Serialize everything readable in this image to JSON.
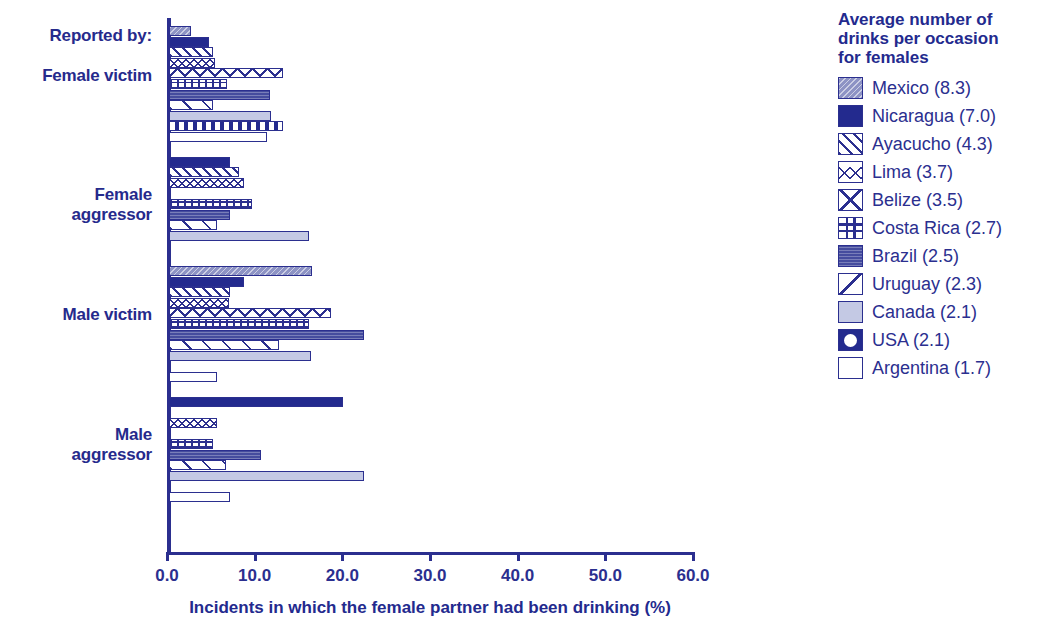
{
  "axis": {
    "x_title": "Incidents in which the female partner had been drinking (%)",
    "x_ticks": [
      "0.0",
      "10.0",
      "20.0",
      "30.0",
      "40.0",
      "50.0",
      "60.0"
    ],
    "reported_by_label": "Reported by:"
  },
  "legend": {
    "title": "Average number of\ndrinks per occasion\nfor females",
    "entries": [
      {
        "label": "Mexico (8.3)",
        "key": "mexico",
        "swatch": "swatch-mexico"
      },
      {
        "label": "Nicaragua (7.0)",
        "key": "nicaragua",
        "swatch": "swatch-nicaragua"
      },
      {
        "label": "Ayacucho (4.3)",
        "key": "ayacucho",
        "swatch": "swatch-ayacucho"
      },
      {
        "label": "Lima (3.7)",
        "key": "lima",
        "swatch": "swatch-lima"
      },
      {
        "label": "Belize (3.5)",
        "key": "belize",
        "swatch": "swatch-belize"
      },
      {
        "label": "Costa Rica (2.7)",
        "key": "costarica",
        "swatch": "swatch-costa-rica"
      },
      {
        "label": "Brazil (2.5)",
        "key": "brazil",
        "swatch": "swatch-brazil"
      },
      {
        "label": "Uruguay (2.3)",
        "key": "uruguay",
        "swatch": "swatch-uruguay"
      },
      {
        "label": "Canada (2.1)",
        "key": "canada",
        "swatch": "swatch-canada"
      },
      {
        "label": "USA (2.1)",
        "key": "usa",
        "swatch": "swatch-usa"
      },
      {
        "label": "Argentina (1.7)",
        "key": "argentina",
        "swatch": "swatch-argentina"
      }
    ]
  },
  "colors": {
    "ink": "#2b2f8f",
    "nicaragua_fill": "#232a8e",
    "mexico_fill": "#8d93c4",
    "brazil_fill": "#454c9e",
    "canada_fill": "#c4c9e4"
  },
  "chart_data": {
    "type": "bar",
    "orientation": "horizontal",
    "title": "",
    "xlabel": "Incidents in which the female partner had been drinking (%)",
    "ylabel": "Reported by:",
    "xlim": [
      0,
      60
    ],
    "xticks": [
      0,
      10,
      20,
      30,
      40,
      50,
      60
    ],
    "grid": false,
    "legend_position": "right",
    "legend_title": "Average number of drinks per occasion for females",
    "categories": [
      "Female victim",
      "Female aggressor",
      "Male victim",
      "Male aggressor"
    ],
    "series": [
      {
        "name": "Mexico (8.3)",
        "values": [
          2.5,
          0.0,
          16.3,
          0.0
        ]
      },
      {
        "name": "Nicaragua (7.0)",
        "values": [
          4.6,
          7.0,
          8.5,
          19.8
        ]
      },
      {
        "name": "Ayacucho (4.3)",
        "values": [
          5.0,
          8.0,
          7.0,
          0.0
        ]
      },
      {
        "name": "Lima (3.7)",
        "values": [
          5.3,
          8.6,
          6.8,
          5.5
        ]
      },
      {
        "name": "Belize (3.5)",
        "values": [
          13.0,
          0.0,
          18.5,
          0.0
        ]
      },
      {
        "name": "Costa Rica (2.7)",
        "values": [
          6.6,
          9.5,
          16.0,
          5.0
        ]
      },
      {
        "name": "Brazil (2.5)",
        "values": [
          11.5,
          7.0,
          22.2,
          10.5
        ]
      },
      {
        "name": "Uruguay (2.3)",
        "values": [
          5.0,
          5.5,
          12.5,
          6.5
        ]
      },
      {
        "name": "Canada (2.1)",
        "values": [
          11.6,
          16.0,
          16.2,
          22.3
        ]
      },
      {
        "name": "USA (2.1)",
        "values": [
          13.0,
          0.0,
          0.0,
          0.0
        ]
      },
      {
        "name": "Argentina (1.7)",
        "values": [
          11.2,
          0.0,
          5.5,
          7.0
        ]
      }
    ]
  }
}
